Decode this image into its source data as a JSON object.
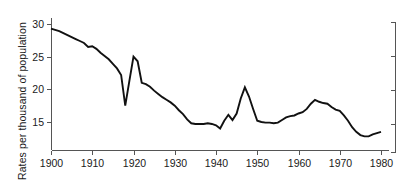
{
  "chart_data": {
    "type": "line",
    "title": "",
    "subtitle": "",
    "xlabel": "",
    "ylabel": "Rates per thousand of population",
    "xlim": [
      1900,
      1980
    ],
    "ylim": [
      11.5,
      31.5
    ],
    "grid": false,
    "legend": false,
    "legend_position": "none",
    "line_color": "#111111",
    "axis_color": "#555555",
    "x_ticks": [
      1900,
      1910,
      1920,
      1930,
      1940,
      1950,
      1960,
      1970,
      1980
    ],
    "x_tick_labels": [
      "1900",
      "1910",
      "1920",
      "1930",
      "1940",
      "1950",
      "1960",
      "1970",
      "1980"
    ],
    "y_ticks": [
      15,
      20,
      25,
      30
    ],
    "y_tick_labels": [
      "15",
      "20",
      "25",
      "30"
    ],
    "right_axis_ticks": [
      15,
      20,
      25,
      30
    ],
    "right_axis_labels": [
      "",
      "",
      "",
      ""
    ],
    "x": [
      1900,
      1901,
      1902,
      1903,
      1904,
      1905,
      1906,
      1907,
      1908,
      1909,
      1910,
      1911,
      1912,
      1913,
      1914,
      1915,
      1916,
      1917,
      1918,
      1919,
      1920,
      1921,
      1922,
      1923,
      1924,
      1925,
      1926,
      1927,
      1928,
      1929,
      1930,
      1931,
      1932,
      1933,
      1934,
      1935,
      1936,
      1937,
      1938,
      1939,
      1940,
      1941,
      1942,
      1943,
      1944,
      1945,
      1946,
      1947,
      1948,
      1949,
      1950,
      1951,
      1952,
      1953,
      1954,
      1955,
      1956,
      1957,
      1958,
      1959,
      1960,
      1961,
      1962,
      1963,
      1964,
      1965,
      1966,
      1967,
      1968,
      1969,
      1970,
      1971,
      1972,
      1973,
      1974,
      1975,
      1976,
      1977,
      1978,
      1979,
      1980
    ],
    "y": [
      29.3,
      29.1,
      28.9,
      28.6,
      28.3,
      28.0,
      27.7,
      27.4,
      27.1,
      26.5,
      26.6,
      26.2,
      25.6,
      25.1,
      24.6,
      23.9,
      23.2,
      22.2,
      17.5,
      21.3,
      25.0,
      24.3,
      21.0,
      20.8,
      20.4,
      19.8,
      19.3,
      18.8,
      18.4,
      18.0,
      17.5,
      16.8,
      16.2,
      15.4,
      14.8,
      14.7,
      14.7,
      14.7,
      14.8,
      14.7,
      14.5,
      14.0,
      15.2,
      16.1,
      15.3,
      16.3,
      18.6,
      20.3,
      18.9,
      17.0,
      15.2,
      15.0,
      14.9,
      14.9,
      14.8,
      14.9,
      15.3,
      15.7,
      15.9,
      16.0,
      16.3,
      16.5,
      17.0,
      17.8,
      18.4,
      18.1,
      17.9,
      17.8,
      17.3,
      16.9,
      16.7,
      16.0,
      15.2,
      14.2,
      13.5,
      13.0,
      12.8,
      12.8,
      13.1,
      13.3,
      13.5
    ]
  }
}
